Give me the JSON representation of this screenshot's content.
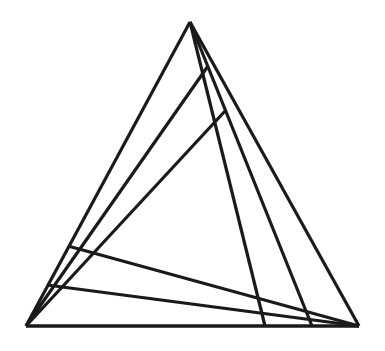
{
  "figure": {
    "background_color": "#ffffff",
    "stroke_color": "#1a1a1a",
    "canvas": {
      "width": 385,
      "height": 351
    }
  },
  "chart_data": {
    "type": "diagram",
    "xlabel": "",
    "ylabel": "",
    "xlim": [
      0,
      385
    ],
    "ylim": [
      0,
      351
    ],
    "grid": false,
    "legend": "none",
    "vertices": [
      {
        "name": "apex",
        "label": "A",
        "x": 190,
        "y": 22
      },
      {
        "name": "bottom-left",
        "label": "B",
        "x": 26,
        "y": 326
      },
      {
        "name": "bottom-right",
        "label": "C",
        "x": 359,
        "y": 326
      }
    ],
    "outline": [
      {
        "name": "left-side",
        "from": "apex",
        "to": "bottom-left",
        "x1": 190,
        "y1": 22,
        "x2": 26,
        "y2": 326,
        "width": 3.2
      },
      {
        "name": "right-side",
        "from": "apex",
        "to": "bottom-right",
        "x1": 190,
        "y1": 22,
        "x2": 359,
        "y2": 326,
        "width": 3.2
      },
      {
        "name": "base",
        "from": "bottom-left",
        "to": "bottom-right",
        "x1": 26,
        "y1": 326,
        "x2": 359,
        "y2": 326,
        "width": 3.2
      }
    ],
    "cevians": [
      {
        "name": "cevian-bl-to-right-upper",
        "from": "bottom-left",
        "to": "right-side",
        "x1": 26,
        "y1": 326,
        "x2": 208,
        "y2": 66,
        "width": 3.2
      },
      {
        "name": "cevian-bl-to-right-middle",
        "from": "bottom-left",
        "to": "right-side",
        "x1": 26,
        "y1": 326,
        "x2": 226,
        "y2": 110,
        "width": 3.2
      },
      {
        "name": "cevian-bl-to-right-lower",
        "from": "bottom-left",
        "to": "bottom-right",
        "x1": 26,
        "y1": 326,
        "x2": 359,
        "y2": 326,
        "width": 3.2
      },
      {
        "name": "cevian-apex-to-base-left",
        "from": "apex",
        "to": "base",
        "x1": 190,
        "y1": 22,
        "x2": 265,
        "y2": 326,
        "width": 3.2
      },
      {
        "name": "cevian-apex-to-base-right",
        "from": "apex",
        "to": "base",
        "x1": 190,
        "y1": 22,
        "x2": 312,
        "y2": 326,
        "width": 3.2
      },
      {
        "name": "transversal-left-to-baseline",
        "from": "left-side",
        "to": "bottom-right",
        "x1": 68,
        "y1": 246,
        "x2": 359,
        "y2": 326,
        "width": 3.2
      },
      {
        "name": "transversal-lower-left-to-baseline",
        "from": "left-side",
        "to": "bottom-right",
        "x1": 47,
        "y1": 285,
        "x2": 359,
        "y2": 326,
        "width": 3.2
      }
    ]
  }
}
